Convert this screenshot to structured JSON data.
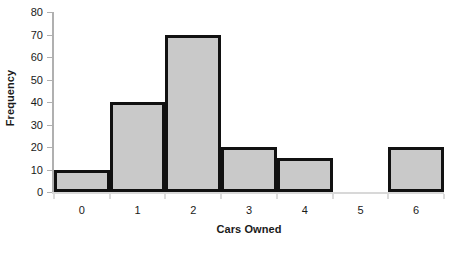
{
  "chart_data": {
    "type": "bar",
    "title": "",
    "subtitle": "",
    "xlabel": "Cars Owned",
    "ylabel": "Frequency",
    "categories": [
      "0",
      "1",
      "2",
      "3",
      "4",
      "5",
      "6"
    ],
    "values": [
      10,
      40,
      70,
      20,
      15,
      0,
      20
    ],
    "ylim": [
      0,
      80
    ],
    "y_ticks": [
      0,
      10,
      20,
      30,
      40,
      50,
      60,
      70,
      80
    ],
    "y_tick_labels": [
      "0",
      "10",
      "20",
      "30",
      "40",
      "50",
      "60",
      "70",
      "80"
    ],
    "grid": false,
    "legend": null,
    "annotations": [],
    "style": {
      "bar_fill": "#c9c9c9",
      "bar_border": "#111111",
      "axis_color": "#b0b0b0",
      "baseline_color": "#d8d8d8",
      "text_color": "#1a1a1a",
      "background": "#ffffff"
    }
  }
}
